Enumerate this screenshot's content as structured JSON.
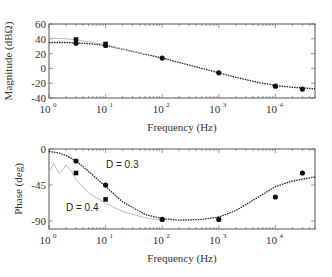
{
  "chart_data": [
    {
      "type": "line",
      "title": "",
      "xlabel": "Frequency (Hz)",
      "ylabel": "Magnitude (dBΩ)",
      "xscale": "log",
      "xlim": [
        1,
        50000
      ],
      "ylim": [
        -40,
        60
      ],
      "grid": false,
      "x_ticks": [
        "10^0",
        "10^1",
        "10^2",
        "10^3",
        "10^4"
      ],
      "y_ticks": [
        60,
        40,
        20,
        0,
        -20,
        -40
      ],
      "series": [
        {
          "name": "Model D = 0.3 (dotted black)",
          "style": "dotted",
          "color": "#222222",
          "x": [
            1,
            2,
            3,
            5,
            10,
            20,
            50,
            100,
            200,
            500,
            1000,
            2000,
            5000,
            10000,
            20000,
            50000
          ],
          "y": [
            35,
            35,
            34.5,
            33.5,
            31,
            26,
            19,
            14,
            8,
            0,
            -6,
            -12,
            -19,
            -23,
            -25.5,
            -27.5
          ]
        },
        {
          "name": "Model D = 0.4 (gray)",
          "style": "solid",
          "color": "#bbbbbb",
          "x": [
            1,
            2,
            3,
            5,
            10,
            20,
            50
          ],
          "y": [
            41,
            40,
            38.5,
            36,
            32,
            26.5,
            19.5
          ]
        },
        {
          "name": "Measured D = 0.3 (circles)",
          "style": "markers",
          "marker": "circle",
          "x": [
            3,
            10,
            100,
            1000,
            10000,
            30000
          ],
          "y": [
            34,
            31,
            14,
            -6,
            -24,
            -28
          ]
        },
        {
          "name": "Measured D = 0.4 (squares)",
          "style": "markers",
          "marker": "square",
          "x": [
            3,
            10
          ],
          "y": [
            39,
            33
          ]
        }
      ]
    },
    {
      "type": "line",
      "title": "",
      "xlabel": "Frequency (Hz)",
      "ylabel": "Phase (deg)",
      "xscale": "log",
      "xlim": [
        1,
        50000
      ],
      "ylim": [
        -100,
        0
      ],
      "grid": false,
      "x_ticks": [
        "10^0",
        "10^1",
        "10^2",
        "10^3",
        "10^4"
      ],
      "y_ticks": [
        0,
        -45,
        -90
      ],
      "annotations": [
        "D = 0.3",
        "D = 0.4"
      ],
      "series": [
        {
          "name": "Model D = 0.3 (dotted black)",
          "style": "dotted",
          "color": "#222222",
          "x": [
            1,
            1.5,
            2,
            3,
            5,
            10,
            20,
            50,
            100,
            200,
            500,
            1000,
            2000,
            5000,
            10000,
            20000,
            50000
          ],
          "y": [
            -3,
            -5,
            -8,
            -15,
            -28,
            -47,
            -66,
            -82,
            -87,
            -89,
            -88,
            -85,
            -77,
            -60,
            -47,
            -40,
            -35
          ]
        },
        {
          "name": "Model D = 0.4 (gray)",
          "style": "solid",
          "color": "#bbbbbb",
          "x": [
            1,
            1.2,
            1.5,
            1.8,
            2,
            2.5,
            3,
            5,
            10,
            20,
            50,
            100
          ],
          "y": [
            -30,
            -18,
            -30,
            -25,
            -20,
            -28,
            -38,
            -55,
            -68,
            -78,
            -86,
            -89
          ]
        },
        {
          "name": "Measured D = 0.3 (circles)",
          "style": "markers",
          "marker": "circle",
          "x": [
            3,
            10,
            100,
            1000,
            10000,
            30000
          ],
          "y": [
            -15,
            -45,
            -88,
            -88,
            -60,
            -30
          ]
        },
        {
          "name": "Measured D = 0.4 (squares)",
          "style": "markers",
          "marker": "square",
          "x": [
            3,
            10
          ],
          "y": [
            -30,
            -63
          ]
        }
      ]
    }
  ],
  "labels": {
    "top_ylabel": "Magnitude (dBΩ)",
    "bottom_ylabel": "Phase (deg)",
    "xlabel": "Frequency (Hz)",
    "annot_d03": "D = 0.3",
    "annot_d04": "D = 0.4",
    "top_yticks": [
      "60",
      "40",
      "20",
      "0",
      "-20",
      "-40"
    ],
    "bottom_yticks": [
      "0",
      "-45",
      "-90"
    ],
    "xtick_base": "10",
    "xtick_exps": [
      "0",
      "1",
      "2",
      "3",
      "4"
    ]
  }
}
